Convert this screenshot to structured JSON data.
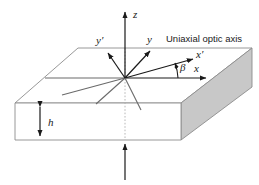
{
  "figure": {
    "background_color": "#ffffff",
    "annotation": {
      "optic_axis_label": "Uniaxial optic axis"
    },
    "axes": [
      {
        "id": "z",
        "label": "z",
        "direction": "up",
        "has_arrow": true
      },
      {
        "id": "y",
        "label": "y",
        "direction": "up-right",
        "has_arrow": true
      },
      {
        "id": "yprime",
        "label": "y′",
        "direction": "up-left",
        "has_arrow": true
      },
      {
        "id": "x",
        "label": "x",
        "direction": "right",
        "has_arrow": true
      },
      {
        "id": "xprime",
        "label": "x′",
        "direction": "right-up",
        "has_arrow": true
      }
    ],
    "angle": {
      "symbol": "β",
      "between": [
        "x",
        "x′"
      ]
    },
    "thickness": {
      "symbol": "h",
      "description": "slab thickness"
    },
    "colors": {
      "stroke": "#1a1a1a",
      "slab_edge": "#8c8c8c",
      "slab_face_shaded": "#c8c8c8",
      "slab_face_top": "#ffffff",
      "text": "#1a1a1a",
      "dotted_guide": "#b0b0b0"
    }
  }
}
